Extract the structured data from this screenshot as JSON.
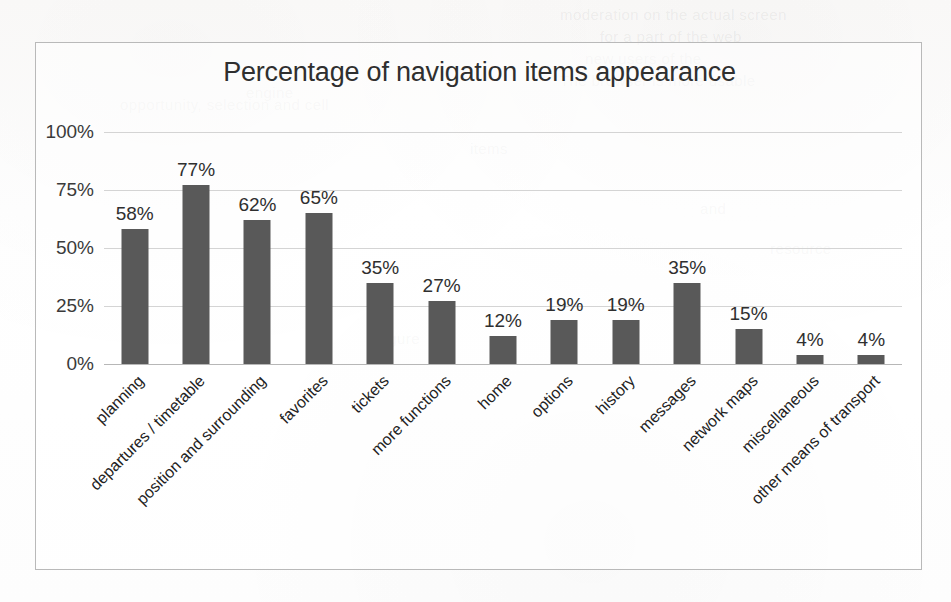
{
  "chart_data": {
    "type": "bar",
    "title": "Percentage of navigation items appearance",
    "xlabel": "",
    "ylabel": "",
    "ylim": [
      0,
      100
    ],
    "ytick_labels": [
      "0%",
      "25%",
      "50%",
      "75%",
      "100%"
    ],
    "ytick_values": [
      0,
      25,
      50,
      75,
      100
    ],
    "grid": true,
    "legend": "none",
    "bar_color": "#595959",
    "gridline_color": "#d4d4d4",
    "border_color": "#b9b9b9",
    "categories": [
      "planning",
      "departures / timetable",
      "position and surrounding",
      "favorites",
      "tickets",
      "more functions",
      "home",
      "options",
      "history",
      "messages",
      "network maps",
      "miscellaneous",
      "other means of transport"
    ],
    "values": [
      58,
      77,
      62,
      65,
      35,
      27,
      12,
      19,
      19,
      35,
      15,
      4,
      4
    ],
    "data_labels": [
      "58%",
      "77%",
      "62%",
      "65%",
      "35%",
      "27%",
      "12%",
      "19%",
      "19%",
      "35%",
      "15%",
      "4%",
      "4%"
    ]
  },
  "ghost_text": [
    {
      "text": "moderation on the actual screen",
      "x": 560,
      "y": 6
    },
    {
      "text": "for a part of the web",
      "x": 600,
      "y": 28
    },
    {
      "text": "new users of the",
      "x": 585,
      "y": 50
    },
    {
      "text": "The browser is more usable",
      "x": 560,
      "y": 72
    },
    {
      "text": "opportunity, selection and cell",
      "x": 120,
      "y": 96
    },
    {
      "text": "engine",
      "x": 246,
      "y": 84
    },
    {
      "text": "items",
      "x": 470,
      "y": 140
    },
    {
      "text": "and",
      "x": 700,
      "y": 200
    },
    {
      "text": "figure",
      "x": 380,
      "y": 330
    },
    {
      "text": "resource",
      "x": 770,
      "y": 240
    }
  ]
}
